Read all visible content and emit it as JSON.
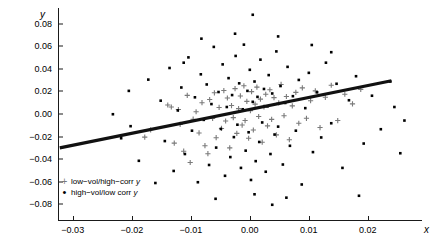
{
  "chart_data": {
    "type": "scatter",
    "title": "",
    "xlabel": "x",
    "ylabel": "y",
    "xlim": [
      -0.0325,
      0.0285
    ],
    "ylim": [
      -0.094,
      0.094
    ],
    "grid": false,
    "xticks": [
      "-0.03",
      "-0.02",
      "-0.01",
      "0.00",
      "0.01",
      "0.02"
    ],
    "xtick_values": [
      -0.03,
      -0.02,
      -0.01,
      0.0,
      0.01,
      0.02
    ],
    "yticks": [
      "0.08",
      "0.06",
      "0.04",
      "0.02",
      "0.00",
      "-0.02",
      "-0.04",
      "-0.06",
      "-0.08"
    ],
    "ytick_values": [
      0.08,
      0.06,
      0.04,
      0.02,
      0.0,
      -0.02,
      -0.04,
      -0.06,
      -0.08
    ],
    "legend_position": "lower-left-inside",
    "legend": [
      {
        "marker": "plus",
        "color": "#7a7a7a",
        "label": "low−vol/high−corr ",
        "italic_suffix": "y"
      },
      {
        "marker": "dot",
        "color": "#000000",
        "label": "high−vol/low corr ",
        "italic_suffix": "y"
      }
    ],
    "trendline": {
      "name": "regression line",
      "color": "#111111",
      "width": 3.2,
      "x": [
        -0.0322,
        0.024
      ],
      "y": [
        -0.03,
        0.0295
      ],
      "slope": 1.058,
      "intercept": 0.0041
    },
    "series": [
      {
        "name": "low−vol/high−corr y",
        "marker": "plus",
        "color": "#7a7a7a",
        "points": [
          [
            -0.0178,
            -0.0205
          ],
          [
            -0.0168,
            -0.014
          ],
          [
            -0.0139,
            0.008
          ],
          [
            -0.0133,
            0.0062
          ],
          [
            -0.0128,
            -0.0258
          ],
          [
            -0.0121,
            0.004
          ],
          [
            -0.0118,
            -0.0092
          ],
          [
            -0.0112,
            -0.033
          ],
          [
            -0.0106,
            0.0165
          ],
          [
            -0.0101,
            -0.043
          ],
          [
            -0.0096,
            -0.0046
          ],
          [
            -0.0091,
            0.002
          ],
          [
            -0.0086,
            -0.0168
          ],
          [
            -0.0081,
            0.01
          ],
          [
            -0.0076,
            -0.0281
          ],
          [
            -0.0071,
            -0.0352
          ],
          [
            -0.0068,
            0.0128
          ],
          [
            -0.0063,
            -0.004
          ],
          [
            -0.006,
            0.0188
          ],
          [
            -0.0057,
            -0.021
          ],
          [
            -0.0052,
            0.0058
          ],
          [
            -0.0048,
            -0.0128
          ],
          [
            -0.0044,
            0.0208
          ],
          [
            -0.0041,
            -0.0062
          ],
          [
            -0.0038,
            0.0142
          ],
          [
            -0.0034,
            -0.03
          ],
          [
            -0.0031,
            0.0075
          ],
          [
            -0.0028,
            -0.0032
          ],
          [
            -0.0025,
            0.0225
          ],
          [
            -0.0022,
            -0.0172
          ],
          [
            -0.0019,
            0.0048
          ],
          [
            -0.0016,
            0.016
          ],
          [
            -0.0013,
            -0.0098
          ],
          [
            -0.001,
            0.025
          ],
          [
            -0.0008,
            -0.0058
          ],
          [
            -0.0005,
            0.0112
          ],
          [
            -0.0002,
            -0.0215
          ],
          [
            0.0001,
            0.003
          ],
          [
            0.0003,
            0.0198
          ],
          [
            0.0006,
            -0.0142
          ],
          [
            0.0009,
            0.0088
          ],
          [
            0.0012,
            0.0238
          ],
          [
            0.0015,
            -0.0022
          ],
          [
            0.0018,
            0.0132
          ],
          [
            0.0021,
            -0.025
          ],
          [
            0.0024,
            0.0062
          ],
          [
            0.0027,
            0.0175
          ],
          [
            0.003,
            -0.0105
          ],
          [
            0.0034,
            0.0215
          ],
          [
            0.0037,
            -0.0048
          ],
          [
            0.0041,
            0.0145
          ],
          [
            0.0045,
            -0.0185
          ],
          [
            0.0049,
            0.0098
          ],
          [
            0.0053,
            0.0262
          ],
          [
            0.0058,
            -0.0015
          ],
          [
            0.0062,
            0.0155
          ],
          [
            0.0067,
            -0.0228
          ],
          [
            0.0072,
            0.0072
          ],
          [
            0.0078,
            0.0192
          ],
          [
            0.0083,
            -0.0082
          ],
          [
            0.0089,
            0.0232
          ],
          [
            0.0096,
            -0.0038
          ],
          [
            0.0103,
            0.0118
          ],
          [
            0.0111,
            0.0205
          ],
          [
            0.0119,
            -0.012
          ],
          [
            0.0128,
            0.0148
          ],
          [
            0.0138,
            0.0255
          ],
          [
            0.0149,
            -0.0058
          ],
          [
            0.0161,
            0.0175
          ],
          [
            0.0174,
            0.009
          ],
          [
            0.0188,
            0.0218
          ]
        ]
      },
      {
        "name": "high−vol/low corr y",
        "marker": "dot",
        "color": "#000000",
        "points": [
          [
            -0.0232,
            -0.0002
          ],
          [
            -0.0202,
            -0.0108
          ],
          [
            -0.0188,
            -0.0415
          ],
          [
            -0.0172,
            0.0305
          ],
          [
            -0.016,
            -0.0612
          ],
          [
            -0.0151,
            0.0118
          ],
          [
            -0.0144,
            -0.024
          ],
          [
            -0.0136,
            0.0408
          ],
          [
            -0.0129,
            -0.0505
          ],
          [
            -0.0122,
            0.0032
          ],
          [
            -0.0116,
            0.0235
          ],
          [
            -0.011,
            -0.0355
          ],
          [
            -0.0104,
            0.0502
          ],
          [
            -0.0098,
            -0.0148
          ],
          [
            -0.0093,
            0.0148
          ],
          [
            -0.0088,
            -0.0605
          ],
          [
            -0.0083,
            0.0352
          ],
          [
            -0.0078,
            -0.0052
          ],
          [
            -0.0073,
            0.0262
          ],
          [
            -0.0069,
            -0.0452
          ],
          [
            -0.0065,
            0.0088
          ],
          [
            -0.0061,
            0.0595
          ],
          [
            -0.0057,
            -0.0298
          ],
          [
            -0.0053,
            0.0195
          ],
          [
            -0.0049,
            -0.0132
          ],
          [
            -0.0046,
            0.044
          ],
          [
            -0.0042,
            -0.0548
          ],
          [
            -0.0039,
            0.0062
          ],
          [
            -0.0036,
            0.0318
          ],
          [
            -0.0033,
            -0.0382
          ],
          [
            -0.003,
            0.0168
          ],
          [
            -0.0027,
            -0.0205
          ],
          [
            -0.0024,
            0.0515
          ],
          [
            -0.0021,
            -0.0095
          ],
          [
            -0.0018,
            0.0272
          ],
          [
            -0.0015,
            -0.0478
          ],
          [
            -0.0012,
            0.0042
          ],
          [
            -0.001,
            0.0615
          ],
          [
            -0.0007,
            -0.0325
          ],
          [
            -0.0004,
            0.0205
          ],
          [
            -0.0002,
            -0.0162
          ],
          [
            0.0,
            0.0392
          ],
          [
            0.0002,
            -0.0585
          ],
          [
            0.0005,
            0.0108
          ],
          [
            0.0005,
            0.088
          ],
          [
            0.0008,
            0.0288
          ],
          [
            0.001,
            -0.0418
          ],
          [
            0.0013,
            0.0152
          ],
          [
            0.0016,
            -0.0248
          ],
          [
            0.0018,
            0.0482
          ],
          [
            0.0021,
            -0.0075
          ],
          [
            0.0024,
            0.0222
          ],
          [
            0.0027,
            -0.0512
          ],
          [
            0.003,
            0.0068
          ],
          [
            0.0032,
            0.0345
          ],
          [
            0.0035,
            -0.0355
          ],
          [
            0.0038,
            0.0182
          ],
          [
            0.0042,
            -0.0182
          ],
          [
            0.0045,
            0.0555
          ],
          [
            0.0048,
            -0.0112
          ],
          [
            0.0052,
            0.0248
          ],
          [
            0.0056,
            -0.0448
          ],
          [
            0.006,
            0.0098
          ],
          [
            0.0064,
            0.0418
          ],
          [
            0.0068,
            -0.0282
          ],
          [
            0.0073,
            0.0158
          ],
          [
            0.0078,
            -0.0148
          ],
          [
            0.0083,
            0.0302
          ],
          [
            0.0088,
            -0.0625
          ],
          [
            0.0094,
            0.0052
          ],
          [
            0.01,
            0.0365
          ],
          [
            0.0107,
            -0.0338
          ],
          [
            0.0114,
            0.0192
          ],
          [
            0.0121,
            -0.0208
          ],
          [
            0.0129,
            0.0455
          ],
          [
            0.0138,
            -0.0082
          ],
          [
            0.0147,
            0.0268
          ],
          [
            0.0157,
            -0.0478
          ],
          [
            0.0168,
            0.0122
          ],
          [
            0.018,
            0.0335
          ],
          [
            0.0193,
            -0.0262
          ],
          [
            0.0207,
            0.0162
          ],
          [
            0.0222,
            -0.0135
          ],
          [
            0.0238,
            0.0288
          ],
          [
            0.0255,
            -0.0348
          ],
          [
            -0.0058,
            -0.0752
          ],
          [
            0.0008,
            -0.0712
          ],
          [
            0.0038,
            -0.0805
          ],
          [
            0.0062,
            -0.0742
          ],
          [
            0.0185,
            -0.0725
          ],
          [
            -0.0112,
            0.0455
          ],
          [
            -0.0082,
            0.0668
          ],
          [
            0.0105,
            0.0612
          ],
          [
            0.0138,
            0.0548
          ],
          [
            -0.0025,
            0.0712
          ],
          [
            0.0048,
            0.0688
          ],
          [
            -0.0205,
            0.0205
          ],
          [
            -0.0218,
            -0.0215
          ],
          [
            0.0245,
            0.0062
          ],
          [
            0.0262,
            -0.0058
          ]
        ]
      }
    ]
  }
}
